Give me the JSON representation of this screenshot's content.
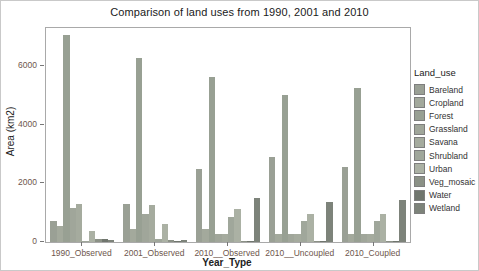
{
  "title": "Comparison of land uses from 1990, 2001 and 2010",
  "chart_data": {
    "type": "bar",
    "title": "Comparison of land uses from 1990, 2001 and 2010",
    "xlabel": "Year_Type",
    "ylabel": "Area (km2)",
    "ylim": [
      0,
      7300
    ],
    "yticks": [
      0,
      2000,
      4000,
      6000
    ],
    "grid": false,
    "legend_title": "Land_use",
    "legend_position": "right",
    "axis_tick_label_color": "#6e564c",
    "categories": [
      "1990_Observed",
      "2001_Observed",
      "2010__Observed",
      "2010__Uncoupled",
      "2010_Coupled"
    ],
    "series": [
      {
        "name": "Bareland",
        "color": "#9aa095",
        "values": [
          730,
          1300,
          2500,
          2905,
          2560
        ]
      },
      {
        "name": "Cropland",
        "color": "#a3a99c",
        "values": [
          560,
          450,
          450,
          275,
          275
        ]
      },
      {
        "name": "Forest",
        "color": "#98a093",
        "values": [
          7050,
          6280,
          5630,
          5000,
          5245
        ]
      },
      {
        "name": "Grassland",
        "color": "#a0a69a",
        "values": [
          1160,
          960,
          280,
          275,
          275
        ]
      },
      {
        "name": "Savana",
        "color": "#a5ab9e",
        "values": [
          1300,
          1270,
          280,
          275,
          275
        ]
      },
      {
        "name": "Shrubland",
        "color": "#a0a79b",
        "values": [
          30,
          100,
          845,
          730,
          730
        ]
      },
      {
        "name": "Urban",
        "color": "#abb1a4",
        "values": [
          390,
          620,
          1130,
          960,
          960
        ]
      },
      {
        "name": "Veg_mosaic",
        "color": "#8b9186",
        "values": [
          110,
          60,
          50,
          50,
          50
        ]
      },
      {
        "name": "Water",
        "color": "#70766e",
        "values": [
          100,
          50,
          40,
          40,
          40
        ]
      },
      {
        "name": "Wetland",
        "color": "#7d837a",
        "values": [
          60,
          60,
          1500,
          1370,
          1430
        ]
      }
    ]
  }
}
